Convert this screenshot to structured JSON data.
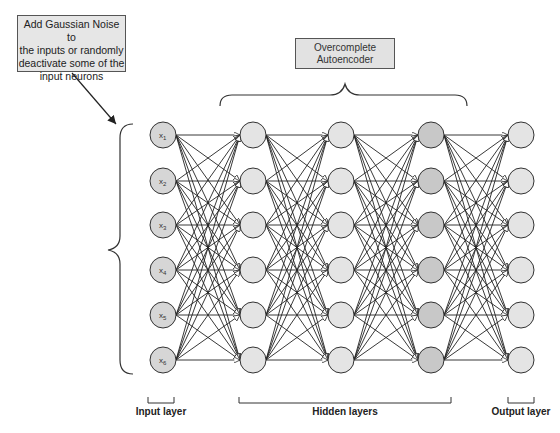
{
  "annotation": {
    "lines": [
      "Add Gaussian Noise to",
      "the inputs or randomly",
      "deactivate some of the",
      "input neurons"
    ]
  },
  "autoencoder_box": {
    "lines": [
      "Overcomplete",
      "Autoencoder"
    ]
  },
  "layers": {
    "input_label": "Input layer",
    "hidden_label": "Hidden layers",
    "output_label": "Output layer"
  },
  "network": {
    "layer_x": [
      163,
      253,
      341,
      431,
      521
    ],
    "node_y": [
      135,
      181,
      225,
      270,
      315,
      360
    ],
    "radius": 13,
    "layer_fill": [
      "#d6d6d6",
      "#e4e4e4",
      "#e4e4e4",
      "#c8c8c8",
      "#e4e4e4"
    ],
    "input_node_labels": [
      "x1",
      "x2",
      "x3",
      "x4",
      "x5",
      "x6"
    ]
  },
  "colors": {
    "stroke": "#333333",
    "edge": "#222222"
  }
}
